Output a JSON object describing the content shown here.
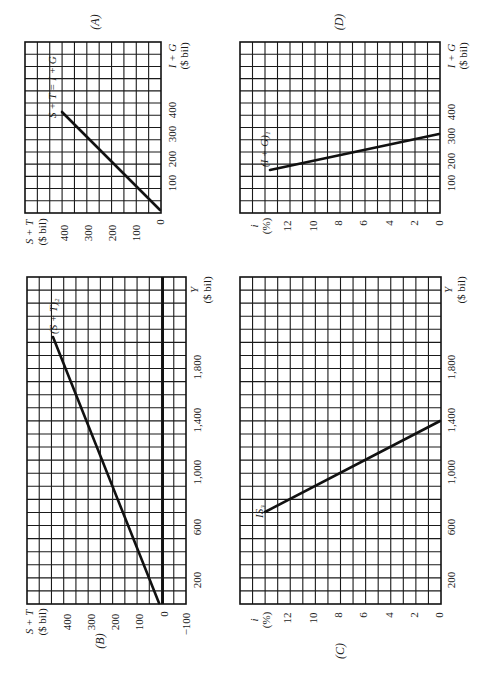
{
  "panels": {
    "A": {
      "id_label": "(A)",
      "x_axis_label": "I + G",
      "x_axis_unit": "($ bil)",
      "y_axis_label": "S + T",
      "y_axis_unit": "($ bil)",
      "x_ticks": [
        "100",
        "200",
        "300",
        "400"
      ],
      "y_ticks": [
        "400",
        "300",
        "200",
        "100",
        "0"
      ],
      "curve_label": "S + T = I + G"
    },
    "B": {
      "id_label": "(B)",
      "x_axis_label": "Y",
      "x_axis_unit": "($ bil)",
      "y_axis_label": "S + T",
      "y_axis_unit": "($ bil)",
      "x_ticks": [
        "200",
        "600",
        "1,000",
        "1,400",
        "1,800"
      ],
      "y_ticks": [
        "400",
        "300",
        "200",
        "100",
        "0",
        "−100"
      ],
      "curve_label": "(S + T)₂"
    },
    "C": {
      "id_label": "(C)",
      "x_axis_label": "Y",
      "x_axis_unit": "($ bil)",
      "y_axis_label": "i",
      "y_axis_unit": "(%)",
      "x_ticks": [
        "200",
        "600",
        "1,000",
        "1,400",
        "1,800"
      ],
      "y_ticks": [
        "12",
        "10",
        "8",
        "6",
        "4",
        "2",
        "0"
      ],
      "curve_label": "IS₃"
    },
    "D": {
      "id_label": "(D)",
      "x_axis_label": "I + G",
      "x_axis_unit": "($ bil)",
      "y_axis_label": "i",
      "y_axis_unit": "(%)",
      "x_ticks": [
        "100",
        "200",
        "300",
        "400"
      ],
      "y_ticks": [
        "12",
        "10",
        "8",
        "6",
        "4",
        "2",
        "0"
      ],
      "curve_label": "(I + G)₁"
    }
  },
  "chart_data": [
    {
      "type": "line",
      "panel": "A",
      "title": "(A)",
      "xlabel": "I + G ($ bil)",
      "ylabel": "S + T ($ bil)",
      "xlim": [
        0,
        550
      ],
      "ylim": [
        0,
        450
      ],
      "grid": true,
      "series": [
        {
          "name": "S + T = I + G",
          "x": [
            0,
            400
          ],
          "y": [
            0,
            400
          ]
        }
      ]
    },
    {
      "type": "line",
      "panel": "B",
      "title": "(B)",
      "xlabel": "Y ($ bil)",
      "ylabel": "S + T ($ bil)",
      "xlim": [
        0,
        2500
      ],
      "ylim": [
        -100,
        550
      ],
      "grid": true,
      "series": [
        {
          "name": "(S + T)₂",
          "x": [
            0,
            2000
          ],
          "y": [
            20,
            450
          ]
        }
      ]
    },
    {
      "type": "line",
      "panel": "C",
      "title": "(C)",
      "xlabel": "Y ($ bil)",
      "ylabel": "i (%)",
      "xlim": [
        0,
        2500
      ],
      "ylim": [
        0,
        16
      ],
      "grid": true,
      "series": [
        {
          "name": "IS₃",
          "x": [
            1400,
            700
          ],
          "y": [
            0,
            14
          ]
        }
      ]
    },
    {
      "type": "line",
      "panel": "D",
      "title": "(D)",
      "xlabel": "I + G ($ bil)",
      "ylabel": "i (%)",
      "xlim": [
        0,
        700
      ],
      "ylim": [
        0,
        16
      ],
      "grid": true,
      "series": [
        {
          "name": "(I + G)₁",
          "x": [
            300,
            160
          ],
          "y": [
            0,
            13
          ]
        }
      ]
    }
  ]
}
